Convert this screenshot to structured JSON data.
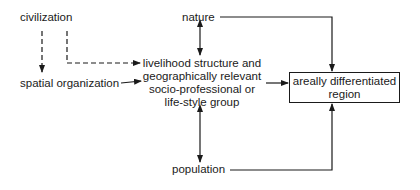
{
  "diagram": {
    "type": "flow",
    "nodes": {
      "civilization": "civilization",
      "spatial_organization": "spatial organization",
      "nature": "nature",
      "population": "population",
      "livelihood": [
        "livelihood structure and",
        "geographically relevant",
        "socio-professional or",
        "life-style group"
      ],
      "region": [
        "areally differentiated",
        "region"
      ]
    },
    "edges": [
      {
        "from": "civilization",
        "to": "spatial organization",
        "style": "dashed"
      },
      {
        "from": "civilization",
        "to": "livelihood structure and geographically relevant socio-professional or life-style group",
        "style": "dashed"
      },
      {
        "from": "spatial organization",
        "to": "livelihood structure and geographically relevant socio-professional or life-style group",
        "style": "solid"
      },
      {
        "from": "nature",
        "to": "livelihood structure and geographically relevant socio-professional or life-style group",
        "style": "solid",
        "bidirectional": true
      },
      {
        "from": "population",
        "to": "livelihood structure and geographically relevant socio-professional or life-style group",
        "style": "solid",
        "bidirectional": true
      },
      {
        "from": "nature",
        "to": "areally differentiated region",
        "style": "solid"
      },
      {
        "from": "population",
        "to": "areally differentiated region",
        "style": "solid"
      },
      {
        "from": "livelihood structure and geographically relevant socio-professional or life-style group",
        "to": "areally differentiated region",
        "style": "solid"
      }
    ],
    "colors": {
      "ink": "#1a1a1a",
      "background": "#ffffff"
    }
  }
}
